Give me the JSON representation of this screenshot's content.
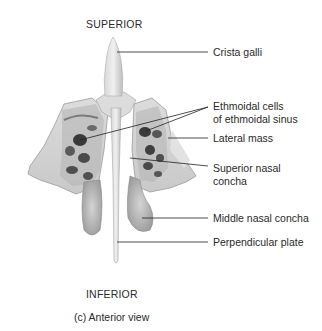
{
  "figure": {
    "orientation_top": "SUPERIOR",
    "orientation_bottom": "INFERIOR",
    "caption": "(c) Anterior view"
  },
  "labels": [
    {
      "id": "crista-galli",
      "text": "Crista galli"
    },
    {
      "id": "ethmoidal-cells",
      "line1": "Ethmoidal cells",
      "line2": "of ethmoidal sinus"
    },
    {
      "id": "lateral-mass",
      "text": "Lateral mass"
    },
    {
      "id": "superior-nasal-concha",
      "line1": "Superior nasal",
      "line2": "concha"
    },
    {
      "id": "middle-nasal-concha",
      "text": "Middle nasal concha"
    },
    {
      "id": "perpendicular-plate",
      "text": "Perpendicular plate"
    }
  ],
  "colors": {
    "bone_light": "#e6e6e6",
    "bone_mid": "#c4c4c4",
    "bone_dark": "#8a8a8a",
    "cell_dark": "#3a3a3a",
    "leader_line": "#222222"
  }
}
